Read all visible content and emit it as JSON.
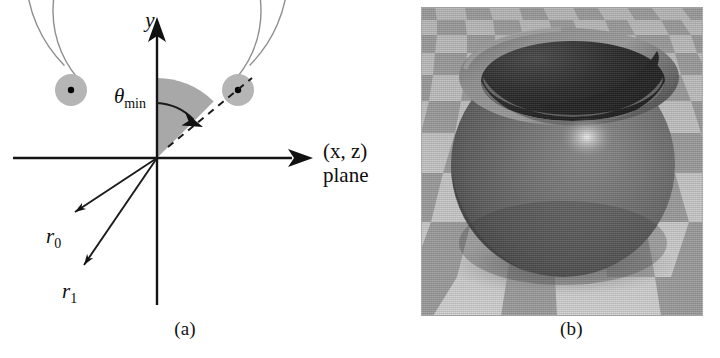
{
  "figure": {
    "panels": [
      {
        "id": "a",
        "caption": "(a)",
        "type": "vector-diagram",
        "description": "Cross-section diagram of a spherical bowl shape in the (x,z)/y plane showing the minimum polar angle and the inner and outer radii."
      },
      {
        "id": "b",
        "caption": "(b)",
        "type": "rendered-image",
        "description": "Grayscale ray-traced render of a bowl shaped solid resting on a perspective checkerboard floor."
      }
    ]
  },
  "diagram": {
    "axes": {
      "y_axis_label": "y",
      "x_axis_label_line1": "(x, z)",
      "x_axis_label_line2": "plane"
    },
    "labels": {
      "theta_min": {
        "symbol": "θ",
        "subscript": "min"
      },
      "r0": {
        "symbol": "r",
        "subscript": "0"
      },
      "r1": {
        "symbol": "r",
        "subscript": "1"
      }
    },
    "geometry": {
      "origin": {
        "x": 157,
        "y": 158
      },
      "inner_radius_px": 104,
      "outer_radius_px": 131,
      "theta_min_deg": 45,
      "arc_gap_top_deg": 90,
      "disk_radius_px": 15,
      "left_disk_center": {
        "x": 71,
        "y": 90
      },
      "right_disk_center": {
        "x": 238,
        "y": 90
      },
      "ray_r0_angle_deg": 212,
      "ray_r1_angle_deg": 232
    },
    "colors": {
      "wedge_fill": "#a8a8a8",
      "disk_fill": "#b5b5b5",
      "arc_stroke": "#8e8e8e",
      "axis_stroke": "#141414",
      "ink": "#0d0d0d"
    }
  },
  "render": {
    "floor": {
      "tile_light": "#c9c9c9",
      "tile_dark": "#9b9b9b",
      "pattern": "checkerboard-perspective"
    },
    "object": {
      "name": "bowl",
      "body_color": "#6b6b6b",
      "rim_color": "#8a8a8a",
      "cavity_color": "#2a2a2a",
      "highlight_color": "#e8e8e8",
      "shadow_color": "#7a7a7a"
    }
  }
}
